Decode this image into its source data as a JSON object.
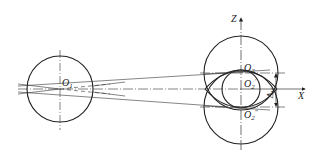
{
  "diagram": {
    "type": "gear-center-distance-variation",
    "colors": {
      "line": "#222222",
      "background": "#ffffff"
    },
    "labels": {
      "o1": "O",
      "o1_sub": "1",
      "o2": "O",
      "o2_sub": "2",
      "o2p": "O",
      "o2p_sub": "2",
      "o2p_sup": "′",
      "o2pp": "O",
      "o2pp_sub": "2",
      "o2pp_sup": "″",
      "z_axis": "Z",
      "x_axis": "X",
      "delta_w": "Δ",
      "delta_w_sub": "W"
    },
    "elements": {
      "left_circle": {
        "cx": 60,
        "cy": 89,
        "r": 33
      },
      "upper_circle": {
        "cx": 241,
        "cy": 73,
        "r": 37
      },
      "middle_circle": {
        "cx": 241,
        "cy": 89,
        "r": 19
      },
      "lower_circle": {
        "cx": 241,
        "cy": 107,
        "r": 37
      },
      "z_axis_x": 241,
      "x_axis_y": 89
    }
  }
}
